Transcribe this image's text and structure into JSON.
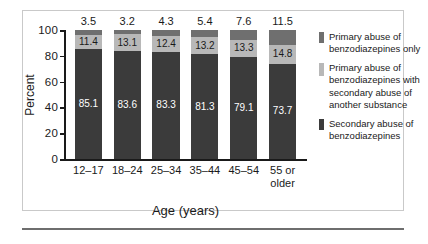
{
  "chart_data": {
    "type": "bar",
    "subtype": "stacked-100-percent",
    "title": "",
    "xlabel": "Age (years)",
    "ylabel": "Percent",
    "ylim": [
      0,
      100
    ],
    "yticks": [
      0,
      20,
      40,
      60,
      80,
      100
    ],
    "grid": false,
    "legend_position": "right",
    "categories": [
      "12–17",
      "18–24",
      "25–34",
      "35–44",
      "45–54",
      "55 or older"
    ],
    "series": [
      {
        "name": "Secondary abuse of benzodiazepines",
        "color": "#3b3b3b",
        "stack_position": "bottom",
        "label_color": "#ffffff",
        "values": [
          85.1,
          83.6,
          83.3,
          81.3,
          79.1,
          73.7
        ]
      },
      {
        "name": "Primary abuse of benzodiazepines with secondary abuse of another substance",
        "color": "#b8b8b8",
        "stack_position": "middle",
        "label_color": "#1a1a1a",
        "values": [
          11.4,
          13.1,
          12.4,
          13.2,
          13.3,
          14.8
        ]
      },
      {
        "name": "Primary abuse of benzodiazepines only",
        "color": "#6f6f6f",
        "stack_position": "top",
        "label_color": "#1a1a1a",
        "label_placement": "above-bar",
        "values": [
          3.5,
          3.2,
          4.3,
          5.4,
          7.6,
          11.5
        ]
      }
    ]
  },
  "axes": {
    "y_tick_labels": [
      "100",
      "80",
      "60",
      "40",
      "20",
      "0"
    ],
    "y_title": "Percent",
    "x_title": "Age (years)",
    "x_tick_labels": [
      "12–17",
      "18–24",
      "25–34",
      "35–44",
      "45–54",
      "55 or older"
    ]
  },
  "legend": {
    "items": [
      {
        "label": "Primary abuse of benzodiazepines only",
        "color": "#6f6f6f"
      },
      {
        "label": "Primary abuse of benzodiazepines with secondary abuse of another substance",
        "color": "#b8b8b8"
      },
      {
        "label": "Secondary abuse of benzodiazepines",
        "color": "#3b3b3b"
      }
    ]
  },
  "value_labels": {
    "top": [
      "3.5",
      "3.2",
      "4.3",
      "5.4",
      "7.6",
      "11.5"
    ],
    "middle": [
      "11.4",
      "13.1",
      "12.4",
      "13.2",
      "13.3",
      "14.8"
    ],
    "bottom": [
      "85.1",
      "83.6",
      "83.3",
      "81.3",
      "79.1",
      "73.7"
    ]
  },
  "colors": {
    "segment_top": "#6f6f6f",
    "segment_middle": "#b8b8b8",
    "segment_bottom": "#3b3b3b",
    "axis": "#1a1a1a",
    "frame": "#c9c9c9",
    "rule": "#6e6e6e"
  }
}
